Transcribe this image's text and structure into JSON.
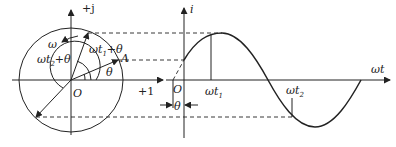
{
  "diagram": {
    "phasor": {
      "imag_axis_label": "+j",
      "real_axis_label": "+1",
      "origin_label": "O",
      "phasor_label": "A",
      "omega_label": "ω",
      "angle_theta_label": "θ",
      "angle_t1_label": "ωt",
      "angle_t1_sub": "1",
      "angle_t1_suffix": "+θ",
      "angle_t2_label": "ωt",
      "angle_t2_sub": "2",
      "angle_t2_suffix": "+θ"
    },
    "waveform": {
      "y_axis_label": "i",
      "x_axis_label": "ωt",
      "origin_label": "O",
      "theta_label": "θ",
      "t1_label": "ωt",
      "t1_sub": "1",
      "t2_label": "ωt",
      "t2_sub": "2"
    },
    "colors": {
      "stroke": "#222222",
      "background": "#ffffff"
    }
  }
}
